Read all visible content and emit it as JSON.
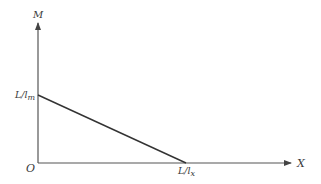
{
  "diagram": {
    "type": "line-graph",
    "axes": {
      "y_label": "M",
      "x_label": "X",
      "origin_label": "O"
    },
    "intercepts": {
      "y_intercept": {
        "base": "L/l",
        "sub": "m"
      },
      "x_intercept": {
        "base": "L/l",
        "sub": "x"
      }
    },
    "line": {
      "from": "L/l_m on M-axis",
      "to": "L/l_x on X-axis",
      "slope": "negative"
    },
    "colors": {
      "axis": "#555555",
      "line": "#333333",
      "text": "#3a3a3a"
    }
  }
}
